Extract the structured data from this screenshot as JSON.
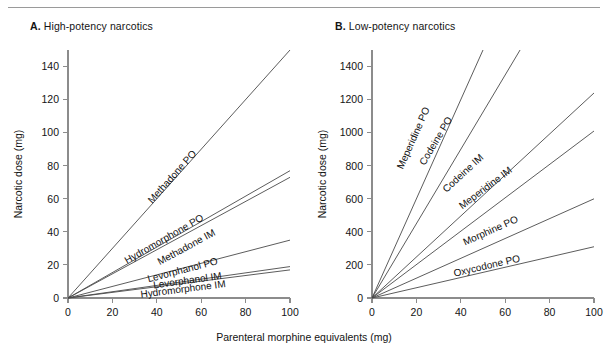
{
  "figure": {
    "x_axis_caption": "Parenteral morphine equivalents (mg)",
    "shared_xlabel": "Parenteral morphine equivalents (mg)",
    "shared_ylabel": "Narcotic dose (mg)"
  },
  "panel_a": {
    "letter": "A.",
    "title": "High-potency narcotics"
  },
  "panel_b": {
    "letter": "B.",
    "title": "Low-potency narcotics"
  },
  "chart_data": [
    {
      "type": "line",
      "title": "A. High-potency narcotics",
      "xlabel": "Parenteral morphine equivalents (mg)",
      "ylabel": "Narcotic dose (mg)",
      "xlim": [
        0,
        100
      ],
      "ylim": [
        0,
        150
      ],
      "xticks": [
        0,
        20,
        40,
        60,
        80,
        100
      ],
      "xtick_labels": [
        "0",
        "20",
        "40",
        "60",
        "80",
        "100"
      ],
      "yticks": [
        0,
        20,
        40,
        60,
        80,
        100,
        120,
        140
      ],
      "ytick_labels": [
        "0",
        "20",
        "40",
        "60",
        "80",
        "100",
        "120",
        "140"
      ],
      "grid": false,
      "legend": "inline-labels",
      "series": [
        {
          "name": "Methadone PO",
          "slope": 1.5,
          "x": [
            0,
            100
          ],
          "values": [
            0,
            150
          ],
          "label_x": 48,
          "label_y": 72
        },
        {
          "name": "Hydromorphone PO",
          "slope": 0.77,
          "x": [
            0,
            100
          ],
          "values": [
            0,
            77
          ],
          "label_x": 44,
          "label_y": 34
        },
        {
          "name": "Methadone IM",
          "slope": 0.73,
          "x": [
            0,
            100
          ],
          "values": [
            0,
            73
          ],
          "label_x": 54,
          "label_y": 29
        },
        {
          "name": "Levorphanol PO",
          "slope": 0.35,
          "x": [
            0,
            100
          ],
          "values": [
            0,
            35
          ],
          "label_x": 52,
          "label_y": 15
        },
        {
          "name": "Levorphanol IM",
          "slope": 0.19,
          "x": [
            0,
            100
          ],
          "values": [
            0,
            19
          ],
          "label_x": 54,
          "label_y": 8.6
        },
        {
          "name": "Hydromorphone IM",
          "slope": 0.17,
          "x": [
            0,
            100
          ],
          "values": [
            0,
            17
          ],
          "label_x": 52,
          "label_y": 3.4
        }
      ]
    },
    {
      "type": "line",
      "title": "B. Low-potency narcotics",
      "xlabel": "Parenteral morphine equivalents (mg)",
      "ylabel": "Narcotic dose (mg)",
      "xlim": [
        0,
        100
      ],
      "ylim": [
        0,
        1500
      ],
      "xticks": [
        0,
        20,
        40,
        60,
        80,
        100
      ],
      "xtick_labels": [
        "0",
        "20",
        "40",
        "60",
        "80",
        "100"
      ],
      "yticks": [
        0,
        200,
        400,
        600,
        800,
        1000,
        1200,
        1400
      ],
      "ytick_labels": [
        "0",
        "200",
        "400",
        "600",
        "800",
        "1000",
        "1200",
        "1400"
      ],
      "grid": false,
      "legend": "inline-labels",
      "series": [
        {
          "name": "Meperidine PO",
          "slope": 30.0,
          "x": [
            0,
            50
          ],
          "values": [
            0,
            1500
          ],
          "label_x": 20,
          "label_y": 960
        },
        {
          "name": "Codeine PO",
          "slope": 22.5,
          "x": [
            0,
            66.7
          ],
          "values": [
            0,
            1500
          ],
          "label_x": 30,
          "label_y": 940
        },
        {
          "name": "Codeine IM",
          "slope": 12.4,
          "x": [
            0,
            100
          ],
          "values": [
            0,
            1240
          ],
          "label_x": 42,
          "label_y": 740
        },
        {
          "name": "Meperidine IM",
          "slope": 10.1,
          "x": [
            0,
            100
          ],
          "values": [
            0,
            1010
          ],
          "label_x": 52,
          "label_y": 650
        },
        {
          "name": "Morphine PO",
          "slope": 6.0,
          "x": [
            0,
            100
          ],
          "values": [
            0,
            600
          ],
          "label_x": 54,
          "label_y": 390
        },
        {
          "name": "Oxycodone PO",
          "slope": 3.1,
          "x": [
            0,
            100
          ],
          "values": [
            0,
            310
          ],
          "label_x": 52,
          "label_y": 175
        }
      ]
    }
  ]
}
